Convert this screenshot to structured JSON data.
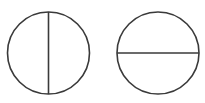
{
  "diagram": {
    "background": "#ffffff",
    "stroke_color": "#3a3a3a",
    "stroke_width": 1.6,
    "shapes": [
      {
        "id": "left-circle",
        "type": "circle",
        "cx": 48.5,
        "cy": 53,
        "r": 41,
        "divider": "vertical",
        "divider_line": {
          "x1": 48.5,
          "y1": 12,
          "x2": 48.5,
          "y2": 94
        }
      },
      {
        "id": "right-circle",
        "type": "circle",
        "cx": 158,
        "cy": 53,
        "r": 41,
        "divider": "horizontal",
        "divider_line": {
          "x1": 117,
          "y1": 53,
          "x2": 199,
          "y2": 53
        }
      }
    ]
  }
}
